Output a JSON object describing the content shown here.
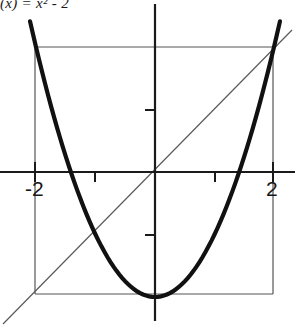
{
  "figure": {
    "title": "(x) = x² - 2",
    "background_color": "#ffffff",
    "ink_color": "#1a1a1a",
    "thin_line_color": "#555555"
  },
  "axes": {
    "x_axis_label": "",
    "y_axis_label": "",
    "x_tick_labels": [
      "-2",
      "2"
    ],
    "y_tick_labels": []
  },
  "labels": {
    "neg_two": "-2",
    "pos_two": "2"
  },
  "chart_data": {
    "type": "line",
    "title": "(x) = x² - 2",
    "xlabel": "",
    "ylabel": "",
    "xlim": [
      -2.5,
      2.33
    ],
    "ylim": [
      -2.55,
      3.1
    ],
    "grid": false,
    "legend": null,
    "series": [
      {
        "name": "parabola",
        "equation": "y = x^2 - 2",
        "style": "thick-curve",
        "x": [
          -2.0,
          -1.75,
          -1.5,
          -1.25,
          -1.0,
          -0.75,
          -0.5,
          -0.25,
          0.0,
          0.25,
          0.5,
          0.75,
          1.0,
          1.25,
          1.5,
          1.75,
          2.0
        ],
        "y": [
          2.0,
          1.0625,
          0.25,
          -0.4375,
          -1.0,
          -1.4375,
          -1.75,
          -1.9375,
          -2.0,
          -1.9375,
          -1.75,
          -1.4375,
          -1.0,
          -0.4375,
          0.25,
          1.0625,
          2.0
        ]
      },
      {
        "name": "identity-line",
        "equation": "y = x",
        "style": "thin-line",
        "x": [
          -2.55,
          2.33
        ],
        "y": [
          -2.55,
          2.33
        ]
      }
    ],
    "annotations": [
      {
        "name": "bounding-box",
        "style": "thin-rectangle",
        "x0": -2.0,
        "x1": 2.0,
        "y0": -2.0,
        "y1": 2.0
      },
      {
        "name": "x-tick",
        "value": -2.0
      },
      {
        "name": "x-tick",
        "value": -1.0
      },
      {
        "name": "x-tick",
        "value": 1.0
      },
      {
        "name": "x-tick",
        "value": 2.0
      },
      {
        "name": "y-tick",
        "value": 1.0
      },
      {
        "name": "y-tick",
        "value": -1.0
      }
    ],
    "x_ticks": [
      -2,
      -1,
      1,
      2
    ],
    "y_ticks": [
      -1,
      1
    ]
  }
}
